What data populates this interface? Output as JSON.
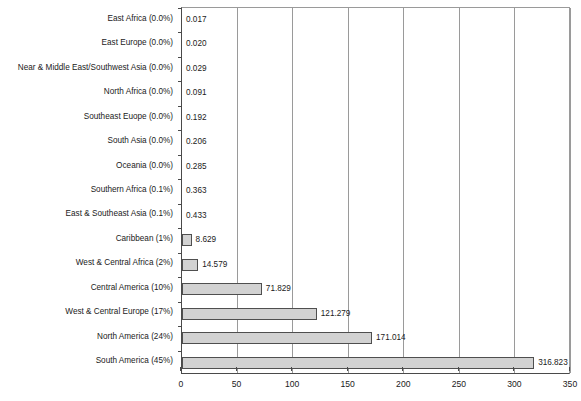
{
  "chart_data": {
    "type": "bar",
    "orientation": "horizontal",
    "title": "",
    "xlabel": "",
    "ylabel": "",
    "xlim": [
      0,
      350
    ],
    "xticks": [
      0,
      50,
      100,
      150,
      200,
      250,
      300,
      350
    ],
    "xticklabels": [
      "0",
      "50",
      "100",
      "150",
      "200",
      "250",
      "300",
      "350"
    ],
    "grid": true,
    "grid_axis": "x",
    "legend": false,
    "bar_fill_color": "#d2d2d2",
    "bar_edge_color": "#4f4f4f",
    "categories": [
      "East Africa (0.0%)",
      "East Europe (0.0%)",
      "Near & Middle East/Southwest Asia (0.0%)",
      "North Africa (0.0%)",
      "Southeast Euope (0.0%)",
      "South Asia (0.0%)",
      "Oceania (0.0%)",
      "Southern Africa (0.1%)",
      "East & Southeast Asia (0.1%)",
      "Caribbean (1%)",
      "West & Central Africa (2%)",
      "Central America (10%)",
      "West & Central Europe (17%)",
      "North America (24%)",
      "South America (45%)"
    ],
    "values": [
      0.017,
      0.02,
      0.029,
      0.091,
      0.192,
      0.206,
      0.285,
      0.363,
      0.433,
      8.629,
      14.579,
      71.829,
      121.279,
      171.014,
      316.823
    ],
    "value_labels": [
      "0.017",
      "0.020",
      "0.029",
      "0.091",
      "0.192",
      "0.206",
      "0.285",
      "0.363",
      "0.433",
      "8.629",
      "14.579",
      "71.829",
      "121.279",
      "171.014",
      "316.823"
    ],
    "percent_shares": [
      "0.0%",
      "0.0%",
      "0.0%",
      "0.0%",
      "0.0%",
      "0.0%",
      "0.0%",
      "0.1%",
      "0.1%",
      "1%",
      "2%",
      "10%",
      "17%",
      "24%",
      "45%"
    ]
  }
}
